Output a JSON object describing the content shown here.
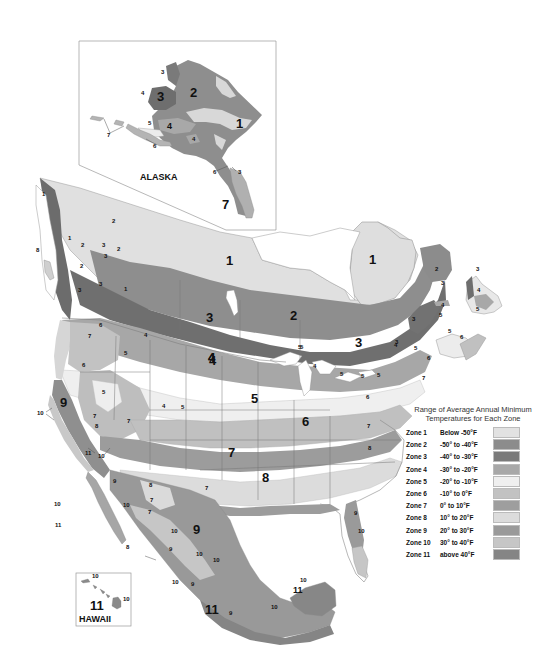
{
  "map": {
    "title": "USDA Plant Hardiness Zone Map of North America",
    "legend": {
      "title_line1": "Range of Average Annual Minimum",
      "title_line2": "Temperatures for Each Zone",
      "zones": [
        {
          "zone": "Zone 1",
          "range": "Below -50°F",
          "color": "#e2e2e2"
        },
        {
          "zone": "Zone 2",
          "range": "-50° to -40°F",
          "color": "#8c8c8c"
        },
        {
          "zone": "Zone 3",
          "range": "-40° to -30°F",
          "color": "#7a7a7a"
        },
        {
          "zone": "Zone 4",
          "range": "-30° to -20°F",
          "color": "#a8a8a8"
        },
        {
          "zone": "Zone 5",
          "range": "-20° to -10°F",
          "color": "#efefef"
        },
        {
          "zone": "Zone 6",
          "range": "-10° to 0°F",
          "color": "#c2c2c2"
        },
        {
          "zone": "Zone 7",
          "range": "0° to 10°F",
          "color": "#9e9e9e"
        },
        {
          "zone": "Zone 8",
          "range": "10° to 20°F",
          "color": "#dcdcdc"
        },
        {
          "zone": "Zone 9",
          "range": "20° to 30°F",
          "color": "#9a9a9a"
        },
        {
          "zone": "Zone 10",
          "range": "30° to 40°F",
          "color": "#c6c6c6"
        },
        {
          "zone": "Zone 11",
          "range": "above 40°F",
          "color": "#858585"
        }
      ]
    },
    "insets": {
      "alaska": {
        "title": "ALASKA",
        "labels": [
          "3",
          "2",
          "1",
          "3",
          "4",
          "4",
          "5",
          "4",
          "7",
          "6",
          "6",
          "3",
          "7"
        ]
      },
      "hawaii": {
        "title": "HAWAII",
        "labels": [
          "10",
          "11",
          "10"
        ]
      }
    },
    "zone_labels": {
      "canada_north": [
        "1",
        "1",
        "1",
        "1",
        "2",
        "2",
        "2",
        "3",
        "3",
        "3",
        "2",
        "3",
        "1"
      ],
      "canada_central": [
        "3",
        "2",
        "3",
        "3",
        "4",
        "5"
      ],
      "atlantic": [
        "2",
        "3",
        "3",
        "4",
        "4",
        "5",
        "5",
        "3",
        "5",
        "6",
        "4",
        "5",
        "6",
        "5",
        "7"
      ],
      "west": [
        "8",
        "6",
        "7",
        "5",
        "4",
        "6",
        "5",
        "9",
        "10",
        "7",
        "8",
        "7",
        "4",
        "5",
        "11",
        "10"
      ],
      "central": [
        "4",
        "4",
        "5",
        "5",
        "5",
        "4",
        "5",
        "6",
        "6",
        "7",
        "7",
        "8",
        "8",
        "7"
      ],
      "south": [
        "9",
        "10",
        "9",
        "8",
        "7",
        "7",
        "10",
        "11",
        "10",
        "9",
        "8",
        "10",
        "10",
        "10",
        "9",
        "11",
        "9",
        "10",
        "11",
        "10"
      ]
    }
  }
}
